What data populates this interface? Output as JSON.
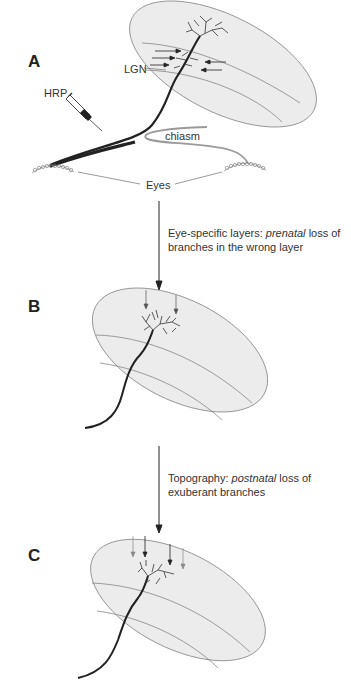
{
  "figure": {
    "panels": [
      {
        "id": "A",
        "label": "A"
      },
      {
        "id": "B",
        "label": "B"
      },
      {
        "id": "C",
        "label": "C"
      }
    ],
    "labels": {
      "lgn": "LGN",
      "hrp": "HRP",
      "chiasm": "chiasm",
      "eyes": "Eyes"
    },
    "transitions": [
      {
        "from": "A",
        "to": "B",
        "text_before": "Eye-specific layers: ",
        "text_italic": "prenatal",
        "text_after": " loss of",
        "line2": "branches in the wrong layer"
      },
      {
        "from": "B",
        "to": "C",
        "text_before": "Topography: ",
        "text_italic": "postnatal",
        "text_after": " loss of",
        "line2": "exuberant branches"
      }
    ],
    "colors": {
      "ink": "#222222",
      "lgn_fill": "#ececec",
      "lgn_stroke": "#8a8a8a",
      "contralateral_axon": "#9a9a9a"
    }
  }
}
